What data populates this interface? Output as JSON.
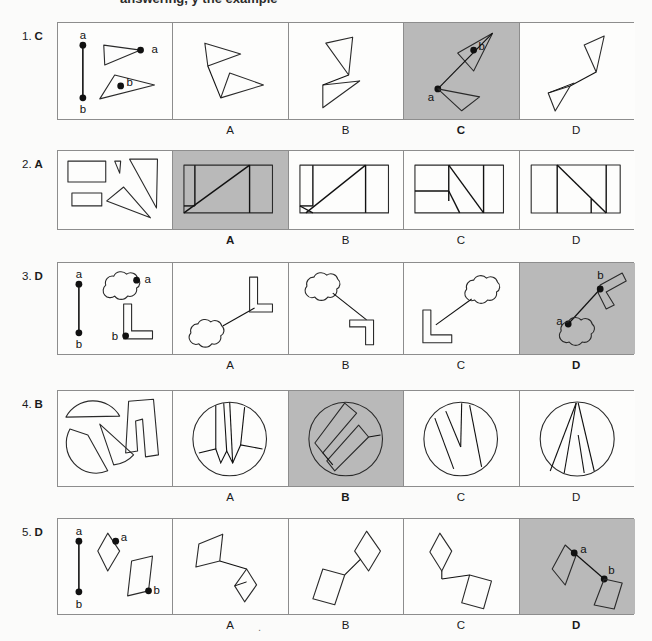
{
  "header": {
    "cut_text": "answering, y      the example"
  },
  "page": {
    "shaded_color": "#b9b9b9",
    "panel_border_color": "#8d8d8d",
    "background": "#fbfbfa"
  },
  "option_letters": [
    "A",
    "B",
    "C",
    "D"
  ],
  "items": [
    {
      "number": "1.",
      "answer": "C",
      "answer_index": 2,
      "prompt_labels": [
        "a",
        "b",
        "a",
        "b"
      ],
      "shape_kind": "triangles"
    },
    {
      "number": "2.",
      "answer": "A",
      "answer_index": 0,
      "prompt_labels": [],
      "shape_kind": "rectangles-and-triangles"
    },
    {
      "number": "3.",
      "answer": "D",
      "answer_index": 3,
      "prompt_labels": [
        "a",
        "b",
        "a",
        "b"
      ],
      "shape_kind": "cloud-and-elbow"
    },
    {
      "number": "4.",
      "answer": "B",
      "answer_index": 1,
      "prompt_labels": [],
      "shape_kind": "circle-segments"
    },
    {
      "number": "5.",
      "answer": "D",
      "answer_index": 3,
      "prompt_labels": [
        "a",
        "b",
        "a",
        "b"
      ],
      "shape_kind": "rhombus-and-parallelogram"
    }
  ],
  "misc": {
    "stray_period": "."
  }
}
